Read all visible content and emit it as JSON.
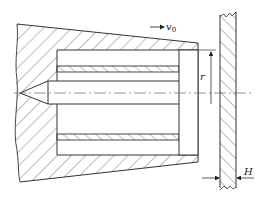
{
  "diagram": {
    "type": "technical cross-section",
    "labels": {
      "velocity": "v",
      "velocity_subscript": "0",
      "radius": "r",
      "thickness": "H"
    },
    "colors": {
      "line": "#333333",
      "hatch": "#555555",
      "centerline": "#666666",
      "background": "#ffffff"
    }
  }
}
